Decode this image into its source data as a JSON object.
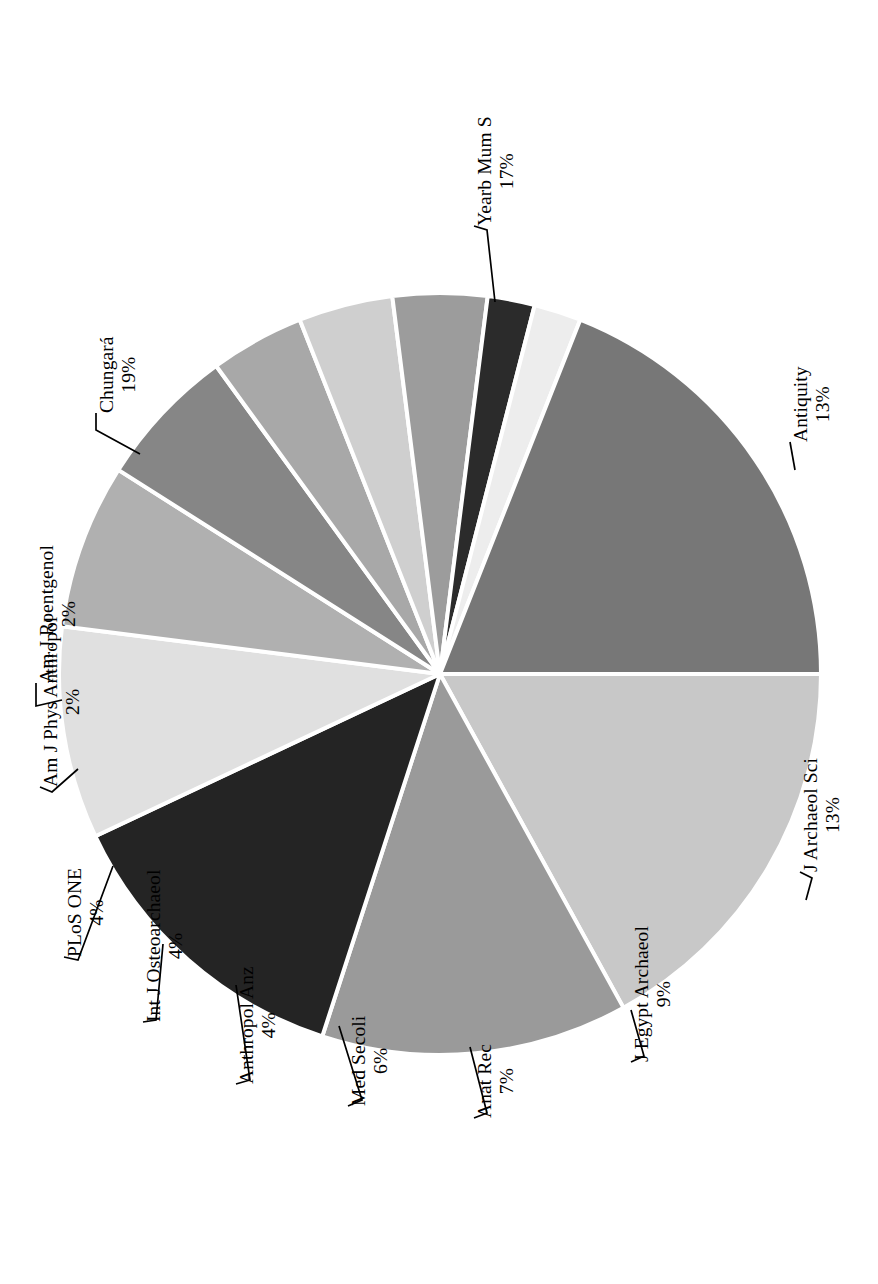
{
  "figure": {
    "type": "pie-chart",
    "orientation": "rotated-90-ccw",
    "background": "#ffffff",
    "slice_border_color": "#ffffff"
  },
  "chart_data": {
    "type": "pie",
    "title": "",
    "xlabel": "",
    "ylabel": "",
    "legend_position": "none",
    "labels_show_percent": true,
    "categories": [
      "Yearb Mum S",
      "Antiquity",
      "J Archaeol Sci",
      "J Egypt Archaeol",
      "Anat Rec",
      "Med Secoli",
      "Anthropol Anz",
      "Int J Osteoarchaeol",
      "PLoS ONE",
      "Am J Phys Anthropol",
      "Am J Roentgenol",
      "Chungará"
    ],
    "values": [
      17,
      13,
      13,
      9,
      7,
      6,
      4,
      4,
      4,
      2,
      2,
      19
    ],
    "value_labels": [
      "17%",
      "13%",
      "13%",
      "9%",
      "7%",
      "6%",
      "4%",
      "4%",
      "4%",
      "2%",
      "2%",
      "19%"
    ],
    "colors": [
      "#c8c8c8",
      "#9a9a9a",
      "#242424",
      "#e0e0e0",
      "#b0b0b0",
      "#868686",
      "#a8a8a8",
      "#cfcfcf",
      "#9c9c9c",
      "#2b2b2b",
      "#ededed",
      "#777777"
    ],
    "start_angle_deg": 0,
    "direction": "clockwise",
    "total": 100
  },
  "labels": [
    {
      "name": "Yearb Mum S",
      "pct": "17%"
    },
    {
      "name": "Antiquity",
      "pct": "13%"
    },
    {
      "name": "J Archaeol Sci",
      "pct": "13%"
    },
    {
      "name": "J Egypt Archaeol",
      "pct": "9%"
    },
    {
      "name": "Anat Rec",
      "pct": "7%"
    },
    {
      "name": "Med Secoli",
      "pct": "6%"
    },
    {
      "name": "Anthropol Anz",
      "pct": "4%"
    },
    {
      "name": "Int J Osteoarchaeol",
      "pct": "4%"
    },
    {
      "name": "PLoS ONE",
      "pct": "4%"
    },
    {
      "name": "Am J Phys Anthropol",
      "pct": "2%"
    },
    {
      "name": "Am J Roentgenol",
      "pct": "2%"
    },
    {
      "name": "Chungará",
      "pct": "19%"
    }
  ]
}
